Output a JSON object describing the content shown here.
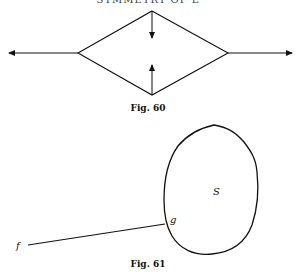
{
  "page": {
    "running_head": "SYMMETRY OF L"
  },
  "figures": [
    {
      "id": "fig60",
      "caption": "Fig. 60",
      "description": "Rhombus with horizontal arrows pointing outward from left and right vertices, and two vertical arrows pointing inward from top and bottom vertices"
    },
    {
      "id": "fig61",
      "caption": "Fig. 61",
      "labels": {
        "region": "S",
        "boundary_point": "g",
        "external_point": "f"
      },
      "description": "Closed oval curve S with a line segment from external point f to boundary point g"
    }
  ],
  "colors": {
    "ink": "#111111",
    "paper": "#ffffff"
  }
}
